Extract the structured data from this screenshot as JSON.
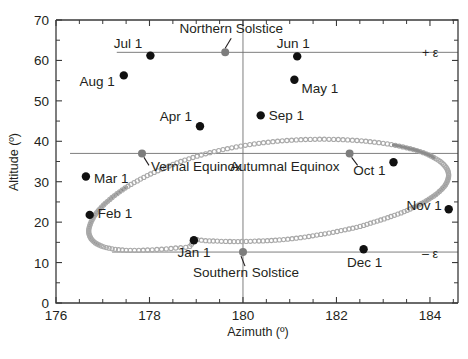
{
  "chart_data": {
    "type": "scatter",
    "title": "",
    "xlabel": "Azimuth (º)",
    "ylabel": "Altitude (º)",
    "xlim": [
      176,
      184.6
    ],
    "ylim": [
      0,
      70
    ],
    "xticks": [
      176,
      178,
      180,
      182,
      184
    ],
    "xticklabels": [
      "176",
      "178",
      "180",
      "182",
      "184"
    ],
    "xtick_minor_step": 0.5,
    "yticks": [
      0,
      10,
      20,
      30,
      40,
      50,
      60,
      70
    ],
    "yticklabels": [
      "0",
      "10",
      "20",
      "30",
      "40",
      "50",
      "60",
      "70"
    ],
    "ytick_minor_step": 5,
    "grid": false,
    "legend": null,
    "reference_lines": [
      {
        "name": "+epsilon",
        "label": "+ ε",
        "y": 62.0,
        "orientation": "horizontal",
        "x_from": 177.3,
        "x_to": 184.6
      },
      {
        "name": "equinox",
        "label": "",
        "y": 37.0,
        "orientation": "horizontal",
        "x_from": 176.3,
        "x_to": 184.6
      },
      {
        "name": "-epsilon",
        "label": "– ε",
        "y": 12.6,
        "orientation": "horizontal",
        "x_from": 177.2,
        "x_to": 184.6
      },
      {
        "name": "meridian",
        "label": "",
        "x": 180.0,
        "orientation": "vertical",
        "y_from": 0,
        "y_to": 70
      }
    ],
    "series": [
      {
        "name": "analemma",
        "comment": "Solar analemma traced as small open circles; azimuth in degrees, altitude in degrees.",
        "points": [
          [
            178.95,
            15.6
          ],
          [
            179.2,
            15.4
          ],
          [
            179.45,
            15.3
          ],
          [
            179.72,
            15.2
          ],
          [
            179.98,
            15.2
          ],
          [
            180.25,
            15.3
          ],
          [
            180.52,
            15.4
          ],
          [
            180.78,
            15.6
          ],
          [
            181.05,
            15.9
          ],
          [
            181.32,
            16.3
          ],
          [
            181.58,
            16.8
          ],
          [
            181.84,
            17.3
          ],
          [
            182.1,
            17.9
          ],
          [
            182.35,
            18.5
          ],
          [
            182.58,
            19.2
          ],
          [
            182.56,
            16.8
          ],
          [
            182.8,
            20.0
          ],
          [
            183.02,
            20.8
          ],
          [
            183.24,
            21.7
          ],
          [
            183.45,
            22.6
          ],
          [
            183.64,
            23.6
          ],
          [
            183.82,
            24.6
          ],
          [
            183.98,
            25.7
          ],
          [
            184.12,
            26.8
          ],
          [
            184.24,
            28.0
          ],
          [
            184.33,
            29.2
          ],
          [
            184.38,
            30.4
          ],
          [
            184.4,
            31.6
          ],
          [
            184.38,
            32.8
          ],
          [
            184.32,
            33.9
          ],
          [
            184.22,
            35.0
          ],
          [
            184.08,
            36.0
          ],
          [
            183.92,
            36.9
          ],
          [
            183.72,
            37.7
          ],
          [
            183.5,
            38.4
          ],
          [
            183.26,
            39.0
          ],
          [
            183.0,
            39.5
          ],
          [
            182.72,
            39.9
          ],
          [
            182.44,
            40.2
          ],
          [
            182.14,
            40.4
          ],
          [
            181.84,
            40.5
          ],
          [
            181.54,
            40.5
          ],
          [
            181.24,
            40.4
          ],
          [
            180.94,
            40.2
          ],
          [
            180.64,
            39.9
          ],
          [
            180.34,
            39.5
          ],
          [
            180.05,
            39.0
          ],
          [
            179.76,
            38.4
          ],
          [
            179.48,
            37.7
          ],
          [
            179.2,
            36.9
          ],
          [
            178.93,
            36.0
          ],
          [
            178.67,
            35.0
          ],
          [
            178.42,
            33.9
          ],
          [
            178.18,
            32.7
          ],
          [
            177.95,
            31.5
          ],
          [
            177.74,
            30.2
          ],
          [
            177.54,
            28.9
          ],
          [
            177.36,
            27.5
          ],
          [
            177.2,
            26.1
          ],
          [
            177.06,
            24.7
          ],
          [
            176.94,
            23.3
          ],
          [
            176.84,
            21.9
          ],
          [
            176.77,
            20.5
          ],
          [
            176.72,
            19.1
          ],
          [
            176.7,
            17.8
          ],
          [
            176.72,
            16.6
          ],
          [
            176.78,
            15.5
          ],
          [
            176.88,
            14.6
          ],
          [
            177.02,
            13.9
          ],
          [
            177.2,
            13.4
          ],
          [
            177.42,
            13.1
          ],
          [
            177.68,
            13.0
          ],
          [
            177.96,
            13.1
          ],
          [
            178.26,
            13.3
          ],
          [
            178.56,
            13.6
          ],
          [
            178.86,
            14.0
          ]
        ]
      }
    ],
    "annotated_points": [
      {
        "name": "jan-1",
        "label": "Jan 1",
        "azimuth": 178.95,
        "altitude": 15.5,
        "marker": "filled-black",
        "label_pos": "below"
      },
      {
        "name": "feb-1",
        "label": "Feb 1",
        "azimuth": 176.72,
        "altitude": 21.8,
        "marker": "filled-black",
        "label_pos": "right"
      },
      {
        "name": "mar-1",
        "label": "Mar 1",
        "azimuth": 176.64,
        "altitude": 31.3,
        "marker": "filled-black",
        "label_pos": "right"
      },
      {
        "name": "apr-1",
        "label": "Apr 1",
        "azimuth": 179.08,
        "altitude": 43.7,
        "marker": "filled-black",
        "label_pos": "left"
      },
      {
        "name": "may-1",
        "label": "May 1",
        "azimuth": 181.1,
        "altitude": 55.2,
        "marker": "filled-black",
        "label_pos": "right"
      },
      {
        "name": "jun-1",
        "label": "Jun 1",
        "azimuth": 181.16,
        "altitude": 61.0,
        "marker": "filled-black",
        "label_pos": "above"
      },
      {
        "name": "jul-1",
        "label": "Jul 1",
        "azimuth": 178.02,
        "altitude": 61.2,
        "marker": "filled-black",
        "label_pos": "above-left"
      },
      {
        "name": "aug-1",
        "label": "Aug 1",
        "azimuth": 177.45,
        "altitude": 56.3,
        "marker": "filled-black",
        "label_pos": "below-left"
      },
      {
        "name": "sep-1",
        "label": "Sep 1",
        "azimuth": 180.38,
        "altitude": 46.4,
        "marker": "filled-black",
        "label_pos": "right"
      },
      {
        "name": "oct-1",
        "label": "Oct 1",
        "azimuth": 183.22,
        "altitude": 34.8,
        "marker": "filled-black",
        "label_pos": "below-left"
      },
      {
        "name": "nov-1",
        "label": "Nov 1",
        "azimuth": 184.4,
        "altitude": 23.2,
        "marker": "filled-black",
        "label_pos": "left"
      },
      {
        "name": "dec-1",
        "label": "Dec 1",
        "azimuth": 182.58,
        "altitude": 13.3,
        "marker": "filled-black",
        "label_pos": "below"
      },
      {
        "name": "northern-solstice",
        "label": "Northern Solstice",
        "azimuth": 179.62,
        "altitude": 62.0,
        "marker": "filled-gray",
        "label_pos": "above",
        "has_leader": true
      },
      {
        "name": "southern-solstice",
        "label": "Southern Solstice",
        "azimuth": 180.0,
        "altitude": 12.6,
        "marker": "filled-gray",
        "label_pos": "below",
        "has_leader": true
      },
      {
        "name": "vernal-equinox",
        "label": "Vernal Equinox",
        "azimuth": 177.84,
        "altitude": 37.0,
        "marker": "filled-gray",
        "label_pos": "below-right",
        "has_leader": true
      },
      {
        "name": "autumnal-equinox",
        "label": "Autumnal Equinox",
        "azimuth": 182.28,
        "altitude": 37.0,
        "marker": "filled-gray",
        "label_pos": "below-left",
        "has_leader": true
      }
    ]
  },
  "axes": {
    "x_title": "Azimuth (º)",
    "y_title": "Altitude (º)",
    "x_tick_labels": [
      "176",
      "178",
      "180",
      "182",
      "184"
    ],
    "y_tick_labels": [
      "0",
      "10",
      "20",
      "30",
      "40",
      "50",
      "60",
      "70"
    ]
  },
  "labels": {
    "plus_epsilon": "+ ε",
    "minus_epsilon": "– ε"
  }
}
